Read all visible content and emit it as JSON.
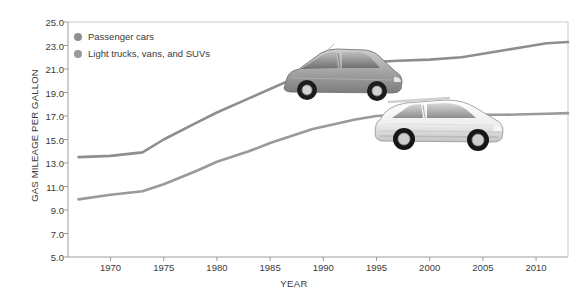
{
  "chart_data": {
    "type": "line",
    "title": "",
    "xlabel": "YEAR",
    "ylabel": "GAS MILEAGE PER GALLON",
    "xlim": [
      1966,
      2013
    ],
    "ylim": [
      5.0,
      25.0
    ],
    "grid": false,
    "legend_position": "top-left",
    "x_ticks": [
      "1970",
      "1975",
      "1980",
      "1985",
      "1990",
      "1995",
      "2000",
      "2005",
      "2010"
    ],
    "x_tick_values": [
      1970,
      1975,
      1980,
      1985,
      1990,
      1995,
      2000,
      2005,
      2010
    ],
    "y_ticks": [
      "5.0",
      "7.0",
      "9.0",
      "11.0",
      "13.0",
      "15.0",
      "17.0",
      "19.0",
      "21.0",
      "23.0",
      "25.0"
    ],
    "y_tick_values": [
      5.0,
      7.0,
      9.0,
      11.0,
      13.0,
      15.0,
      17.0,
      19.0,
      21.0,
      23.0,
      25.0
    ],
    "x": [
      1967,
      1970,
      1973,
      1975,
      1978,
      1980,
      1983,
      1985,
      1987,
      1989,
      1991,
      1993,
      1995,
      1997,
      2000,
      2003,
      2005,
      2007,
      2009,
      2011,
      2013
    ],
    "series": [
      {
        "name": "Passenger cars",
        "color": "#8e8e8e",
        "values": [
          13.5,
          13.6,
          13.9,
          15.0,
          16.4,
          17.3,
          18.5,
          19.3,
          20.1,
          20.8,
          21.2,
          21.5,
          21.6,
          21.7,
          21.8,
          22.0,
          22.3,
          22.6,
          22.9,
          23.2,
          23.3
        ]
      },
      {
        "name": "Light trucks, vans, and SUVs",
        "color": "#9a9a9a",
        "values": [
          9.9,
          10.3,
          10.6,
          11.2,
          12.3,
          13.1,
          14.0,
          14.7,
          15.3,
          15.9,
          16.3,
          16.7,
          17.0,
          17.1,
          17.1,
          17.1,
          17.1,
          17.1,
          17.15,
          17.2,
          17.25
        ]
      }
    ],
    "annotations": [
      {
        "name": "passenger-car-photo",
        "label": "hatchback passenger car photo",
        "x_center": 1994,
        "y_center": 20.6
      },
      {
        "name": "suv-photo",
        "label": "white SUV photo",
        "x_center": 2001,
        "y_center": 16.6
      }
    ]
  },
  "axis": {
    "line_color": "#9d9d9d"
  }
}
